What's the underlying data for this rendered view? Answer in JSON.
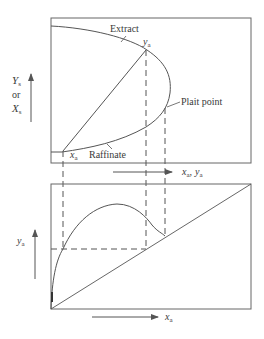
{
  "colors": {
    "line": "#555555",
    "text": "#3a3a3a",
    "background": "#ffffff"
  },
  "top_panel": {
    "y_axis_label": {
      "main1": "Y",
      "sub1": "s",
      "or": "or",
      "main2": "X",
      "sub2": "s"
    },
    "x_axis_label": {
      "x": "x",
      "x_sub": "a",
      "sep": ",",
      "y": "y",
      "y_sub": "a"
    },
    "annotations": {
      "extract": "Extract",
      "raffinate": "Raffinate",
      "plait_point": "Plait point",
      "ya_point": {
        "main": "y",
        "sub": "a"
      },
      "xa_point": {
        "main": "x",
        "sub": "a"
      }
    }
  },
  "bottom_panel": {
    "y_axis_label": {
      "main": "y",
      "sub": "a"
    },
    "x_axis_label": {
      "main": "x",
      "sub": "a"
    }
  }
}
